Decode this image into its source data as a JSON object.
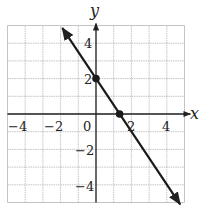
{
  "chart_data": {
    "type": "line",
    "title": "",
    "xlabel": "x",
    "ylabel": "y",
    "xlim": [
      -5,
      5
    ],
    "ylim": [
      -5,
      5
    ],
    "grid": true,
    "x_ticks": [
      -4,
      -2,
      0,
      2,
      4
    ],
    "x_tick_labels": [
      "−4",
      "−2",
      "0",
      "2",
      "4"
    ],
    "y_ticks": [
      4,
      2,
      -2,
      -4
    ],
    "y_tick_labels": [
      "4",
      "2",
      "−2",
      "−4"
    ],
    "series": [
      {
        "name": "y = −(3/2)x + 2",
        "slope": -1.5,
        "intercept": 2,
        "x": [
          -1.9,
          4.75
        ],
        "y": [
          4.85,
          -5.1
        ],
        "arrows_both_ends": true
      }
    ],
    "points": [
      {
        "label": "y-intercept",
        "x": 0,
        "y": 2
      },
      {
        "label": "x-intercept",
        "x": 1.333,
        "y": 0
      }
    ],
    "colors": {
      "line": "#1a1a1a",
      "grid": "#b5b5b5",
      "axis": "#222222"
    }
  }
}
